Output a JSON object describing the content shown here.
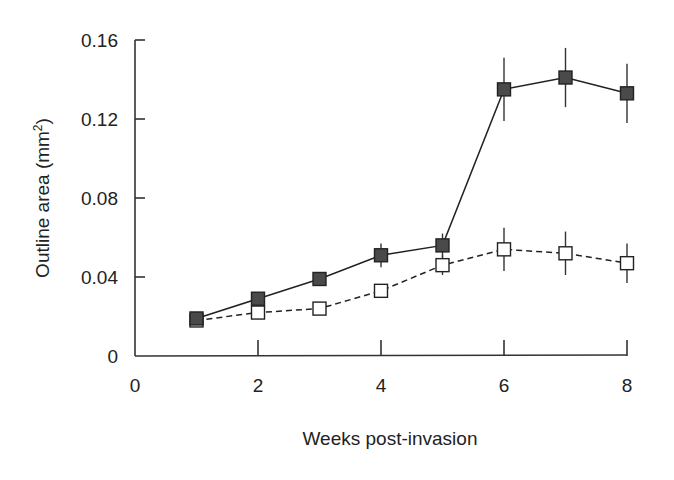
{
  "chart_data": {
    "type": "line",
    "title": "",
    "xlabel": "Weeks post-invasion",
    "ylabel": "Outline area (mm²)",
    "ylabel_main": "Outline area (mm",
    "ylabel_sup": "2",
    "ylabel_end": ")",
    "xlim": [
      0,
      8
    ],
    "ylim": [
      0,
      0.16
    ],
    "x_ticks": [
      0,
      2,
      4,
      6,
      8
    ],
    "x_tick_labels": [
      "0",
      "2",
      "4",
      "6",
      "8"
    ],
    "y_ticks": [
      0,
      0.04,
      0.08,
      0.12,
      0.16
    ],
    "y_tick_labels": [
      "0",
      "0.04",
      "0.08",
      "0.12",
      "0.16"
    ],
    "grid": false,
    "legend": null,
    "x": [
      1,
      2,
      3,
      4,
      5,
      6,
      7,
      8
    ],
    "series": [
      {
        "name": "filled squares (solid line)",
        "marker": "filled-square",
        "line": "solid",
        "color": "#3a3a3a",
        "values": [
          0.019,
          0.029,
          0.039,
          0.051,
          0.056,
          0.135,
          0.141,
          0.133
        ],
        "error": [
          0.0,
          0.0,
          0.0,
          0.006,
          0.006,
          0.016,
          0.015,
          0.015
        ]
      },
      {
        "name": "open squares (dashed line)",
        "marker": "open-square",
        "line": "dashed",
        "color": "#ffffff",
        "values": [
          0.018,
          0.022,
          0.024,
          0.033,
          0.046,
          0.054,
          0.052,
          0.047
        ],
        "error": [
          0.0,
          0.0,
          0.0,
          0.0,
          0.005,
          0.011,
          0.011,
          0.01
        ]
      }
    ]
  }
}
